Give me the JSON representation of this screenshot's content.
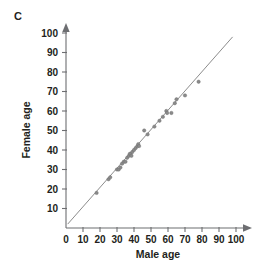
{
  "panel": {
    "label": "C"
  },
  "chart_data": {
    "type": "scatter",
    "title": "",
    "subtitle": "",
    "xlabel": "Male age",
    "ylabel": "Female age",
    "xlim": [
      0,
      100
    ],
    "ylim": [
      0,
      100
    ],
    "xticks": [
      0,
      10,
      20,
      30,
      40,
      50,
      60,
      70,
      80,
      90,
      100
    ],
    "yticks": [
      0,
      10,
      20,
      30,
      40,
      50,
      60,
      70,
      80,
      90,
      100
    ],
    "xtick_labels": [
      "0",
      "10",
      "20",
      "30",
      "40",
      "50",
      "60",
      "70",
      "80",
      "90",
      "100"
    ],
    "ytick_labels": [
      "0",
      "10",
      "20",
      "30",
      "40",
      "50",
      "60",
      "70",
      "80",
      "90",
      "100"
    ],
    "grid": false,
    "legend": null,
    "legend_position": "none",
    "point_color": "#8a8a8a",
    "line_color": "#8c8c8c",
    "axis_color": "#6d6e71",
    "series": [
      {
        "name": "Couples",
        "marker": "circle",
        "points": [
          [
            18,
            18
          ],
          [
            25,
            25
          ],
          [
            26,
            26
          ],
          [
            30,
            30
          ],
          [
            31,
            30
          ],
          [
            32,
            31
          ],
          [
            33,
            33
          ],
          [
            34,
            34
          ],
          [
            35,
            34
          ],
          [
            36,
            36
          ],
          [
            37,
            37
          ],
          [
            37.5,
            38
          ],
          [
            38,
            38
          ],
          [
            38.5,
            37
          ],
          [
            39,
            39
          ],
          [
            40,
            40
          ],
          [
            41,
            41
          ],
          [
            42,
            42
          ],
          [
            42.5,
            43
          ],
          [
            43,
            42
          ],
          [
            46,
            50
          ],
          [
            48,
            48
          ],
          [
            52,
            52
          ],
          [
            55,
            55
          ],
          [
            57,
            57
          ],
          [
            59,
            60
          ],
          [
            59.5,
            59
          ],
          [
            62,
            59
          ],
          [
            64,
            64
          ],
          [
            65,
            66
          ],
          [
            70,
            68
          ],
          [
            78,
            75
          ]
        ]
      }
    ],
    "reference_line": {
      "name": "identity line",
      "from": [
        1,
        2
      ],
      "to": [
        98,
        98
      ],
      "description": "y = x diagonal"
    }
  }
}
